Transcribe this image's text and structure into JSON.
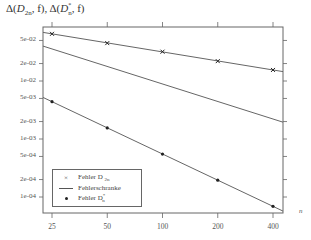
{
  "chart_data": {
    "type": "line",
    "xlabel": "n",
    "ylabel": "",
    "xscale": "log2",
    "yscale": "log10",
    "x": [
      25,
      50,
      100,
      200,
      400
    ],
    "x_tick_labels": [
      "25",
      "50",
      "100",
      "200",
      "400"
    ],
    "y_tick_labels": [
      "5e-02",
      "2e-02",
      "1e-02",
      "5e-03",
      "2e-03",
      "1e-03",
      "5e-04",
      "2e-04",
      "1e-04"
    ],
    "y_tick_values": [
      0.05,
      0.02,
      0.01,
      0.005,
      0.002,
      0.001,
      0.0005,
      0.0002,
      0.0001
    ],
    "ylim": [
      6e-05,
      0.08
    ],
    "grid": false,
    "legend_position": "lower left",
    "series": [
      {
        "name": "Fehler D_{2n}",
        "marker": "x",
        "line": true,
        "values": [
          0.065,
          0.045,
          0.032,
          0.022,
          0.0155
        ]
      },
      {
        "name": "Fehlerschranke",
        "marker": "none",
        "line": true,
        "x_range": [
          22,
          440
        ],
        "values_at_ends": [
          0.04,
          0.00195
        ]
      },
      {
        "name": "Fehler D*_n",
        "marker": "dot",
        "line": true,
        "values": [
          0.0044,
          0.00155,
          0.00055,
          0.000195,
          6.9e-05
        ]
      }
    ]
  },
  "title": {
    "text_delta1": "Δ(",
    "text_d1": "D",
    "text_sub1": "2n",
    "text_mid": ", f), Δ(",
    "text_d2": "D",
    "text_sup2": "*",
    "text_sub2": "n",
    "text_end": ", f)"
  },
  "axis": {
    "x_label": "n",
    "x_ticks": [
      "25",
      "50",
      "100",
      "200",
      "400"
    ],
    "y_ticks": [
      "5e-02",
      "2e-02",
      "1e-02",
      "5e-03",
      "2e-03",
      "1e-03",
      "5e-04",
      "2e-04",
      "1e-04"
    ]
  },
  "legend": {
    "items": [
      {
        "symbol": "×",
        "label": "Fehler D",
        "sub": "2n",
        "sup": ""
      },
      {
        "symbol": "",
        "label": "Fehlerschranke",
        "sub": "",
        "sup": ""
      },
      {
        "symbol": "",
        "label": "Fehler D",
        "sub": "n",
        "sup": "*"
      }
    ]
  }
}
